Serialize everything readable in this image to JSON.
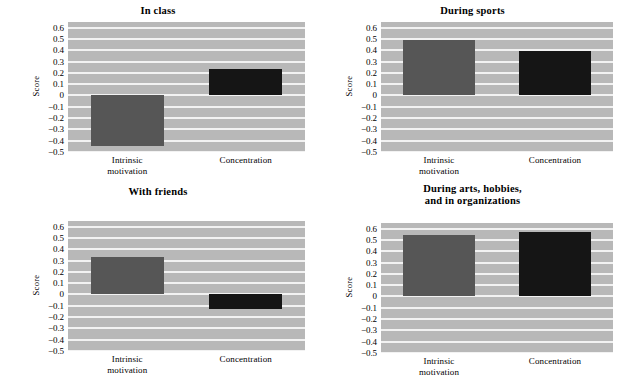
{
  "figure": {
    "background": "#ffffff",
    "plot_background": "#b8b8b8",
    "gridline_color": "#f2f2f2",
    "colors": {
      "intrinsic_motivation": "#565656",
      "concentration": "#151515"
    },
    "y_axis_label": "Score",
    "y_ticks": [
      "0.6",
      "0.5",
      "0.4",
      "0.3",
      "0.2",
      "0.1",
      "0",
      "−0.1",
      "−0.2",
      "−0.3",
      "−0.4",
      "−0.5"
    ],
    "x_categories": [
      "Intrinsic\nmotivation",
      "Concentration"
    ]
  },
  "chart_data": [
    {
      "type": "bar",
      "title": "In class",
      "categories": [
        "Intrinsic motivation",
        "Concentration"
      ],
      "values": [
        -0.45,
        0.23
      ],
      "xlabel": "",
      "ylabel": "Score",
      "ylim": [
        -0.5,
        0.65
      ],
      "yticks": [
        -0.5,
        -0.4,
        -0.3,
        -0.2,
        -0.1,
        0,
        0.1,
        0.2,
        0.3,
        0.4,
        0.5,
        0.6
      ],
      "grid": true,
      "legend": "none"
    },
    {
      "type": "bar",
      "title": "During sports",
      "categories": [
        "Intrinsic motivation",
        "Concentration"
      ],
      "values": [
        0.49,
        0.39
      ],
      "xlabel": "",
      "ylabel": "Score",
      "ylim": [
        -0.5,
        0.65
      ],
      "yticks": [
        -0.5,
        -0.4,
        -0.3,
        -0.2,
        -0.1,
        0,
        0.1,
        0.2,
        0.3,
        0.4,
        0.5,
        0.6
      ],
      "grid": true,
      "legend": "none"
    },
    {
      "type": "bar",
      "title": "With friends",
      "categories": [
        "Intrinsic motivation",
        "Concentration"
      ],
      "values": [
        0.33,
        -0.13
      ],
      "xlabel": "",
      "ylabel": "Score",
      "ylim": [
        -0.5,
        0.65
      ],
      "yticks": [
        -0.5,
        -0.4,
        -0.3,
        -0.2,
        -0.1,
        0,
        0.1,
        0.2,
        0.3,
        0.4,
        0.5,
        0.6
      ],
      "grid": true,
      "legend": "none"
    },
    {
      "type": "bar",
      "title": "During arts, hobbies,\nand in organizations",
      "categories": [
        "Intrinsic motivation",
        "Concentration"
      ],
      "values": [
        0.54,
        0.57
      ],
      "xlabel": "",
      "ylabel": "Score",
      "ylim": [
        -0.5,
        0.65
      ],
      "yticks": [
        -0.5,
        -0.4,
        -0.3,
        -0.2,
        -0.1,
        0,
        0.1,
        0.2,
        0.3,
        0.4,
        0.5,
        0.6
      ],
      "grid": true,
      "legend": "none"
    }
  ]
}
